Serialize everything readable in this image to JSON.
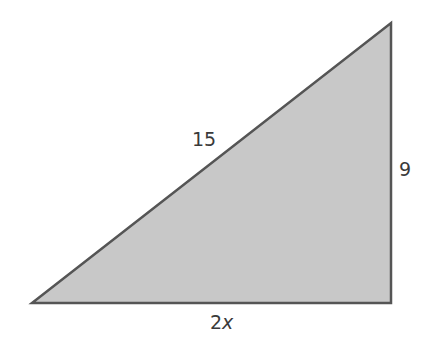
{
  "diagram": {
    "type": "right-triangle",
    "vertices": {
      "bottom_left": [
        32,
        303
      ],
      "bottom_right": [
        391,
        303
      ],
      "top_right": [
        391,
        23
      ]
    },
    "fill_color": "#c8c8c8",
    "stroke_color": "#555555",
    "right_angle_at": "bottom_right",
    "labels": {
      "hypotenuse": "15",
      "vertical_leg": "9",
      "base_coefficient": "2",
      "base_variable": "x"
    }
  }
}
